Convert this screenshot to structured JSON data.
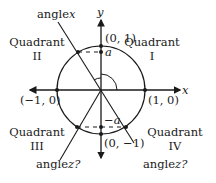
{
  "diagram": {
    "type": "unit-circle",
    "axes": {
      "x_label": "x",
      "y_label": "y"
    },
    "points": {
      "top": "(0, 1)",
      "bottom": "(0, −1)",
      "left": "(−1, 0)",
      "right": "(1, 0)"
    },
    "quadrants": [
      {
        "word": "Quadrant",
        "numeral": "I"
      },
      {
        "word": "Quadrant",
        "numeral": "II"
      },
      {
        "word": "Quadrant",
        "numeral": "III"
      },
      {
        "word": "Quadrant",
        "numeral": "IV"
      }
    ],
    "angle_labels": {
      "x_prefix": "angle",
      "x_var": "x",
      "z_left_prefix": "angle",
      "z_left_var": "z?",
      "z_right_prefix": "angle",
      "z_right_var": "z?"
    },
    "markers": {
      "a": "a",
      "neg_a": "−a"
    },
    "colors": {
      "line": "#1a1a1a",
      "background": "#ffffff"
    }
  }
}
